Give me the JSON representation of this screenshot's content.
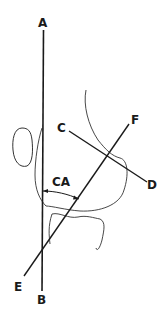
{
  "diagram": {
    "colors": {
      "line": "#1a1a1a",
      "outline": "#333333",
      "background": "#ffffff"
    },
    "labels": {
      "A": "A",
      "B": "B",
      "C": "C",
      "D": "D",
      "E": "E",
      "F": "F",
      "angle": "CA"
    },
    "lines": [
      {
        "name": "A-B",
        "from": "A",
        "to": "B"
      },
      {
        "name": "C-D",
        "from": "C",
        "to": "D"
      },
      {
        "name": "E-F",
        "from": "E",
        "to": "F"
      }
    ],
    "angle": {
      "label": "CA",
      "between": [
        "A-B",
        "E-F"
      ]
    }
  }
}
